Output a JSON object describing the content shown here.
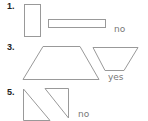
{
  "problems": [
    {
      "number": "1.",
      "answer": "no",
      "shapes": [
        "tall-rectangle",
        "wide-rectangle"
      ]
    },
    {
      "number": "3.",
      "answer": "yes",
      "shapes": [
        "trapezoid",
        "inverted-trapezoid"
      ]
    },
    {
      "number": "5.",
      "answer": "no",
      "shapes": [
        "right-triangle-lower-left",
        "right-triangle-upper-right"
      ]
    }
  ],
  "colors": {
    "stroke": "#999999",
    "text": "#222222",
    "answer": "#777777"
  }
}
